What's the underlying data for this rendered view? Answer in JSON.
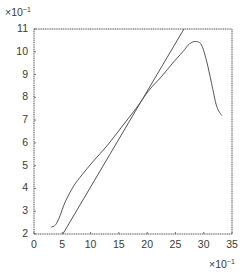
{
  "chart_data": {
    "type": "line",
    "title": "",
    "xlabel": "",
    "ylabel": "",
    "x_multiplier": "×10",
    "x_multiplier_exp": "−1",
    "y_multiplier": "×10",
    "y_multiplier_exp": "−1",
    "xlim": [
      0,
      35
    ],
    "ylim": [
      2,
      11
    ],
    "xticks": [
      0,
      5,
      10,
      15,
      20,
      25,
      30,
      35
    ],
    "yticks": [
      2,
      3,
      4,
      5,
      6,
      7,
      8,
      9,
      10,
      11
    ],
    "xtick_labels": [
      "0",
      "5",
      "10",
      "15",
      "20",
      "25",
      "30",
      "35"
    ],
    "ytick_labels": [
      "2",
      "3",
      "4",
      "5",
      "6",
      "7",
      "8",
      "9",
      "10",
      "11"
    ],
    "grid": false,
    "legend": null,
    "series": [
      {
        "name": "curve",
        "x": [
          3.0,
          3.8,
          4.6,
          5.5,
          7.0,
          8.5,
          10.5,
          13.0,
          15.5,
          18.0,
          20.3,
          22.5,
          24.5,
          26.3,
          27.5,
          28.6,
          29.6,
          30.5,
          31.4,
          32.3,
          33.2
        ],
        "y": [
          2.3,
          2.4,
          2.8,
          3.4,
          4.1,
          4.6,
          5.2,
          5.9,
          6.7,
          7.5,
          8.3,
          8.9,
          9.5,
          10.0,
          10.35,
          10.45,
          10.3,
          9.6,
          8.6,
          7.6,
          7.2
        ]
      },
      {
        "name": "straight-line",
        "x": [
          5.1,
          26.5
        ],
        "y": [
          2.0,
          11.0
        ]
      }
    ]
  }
}
